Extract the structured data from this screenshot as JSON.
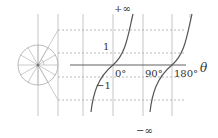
{
  "diagram": {
    "labels": {
      "plus_infinity": "+∞",
      "minus_infinity": "−∞",
      "one": "1",
      "minus_one": "−1",
      "zero_deg": "0°",
      "ninety_deg": "90°",
      "one_eighty_deg": "180°",
      "theta": "θ"
    },
    "colors": {
      "grid": "#b8b8b8",
      "curve": "#555555",
      "axis": "#606060",
      "text": "#333333"
    }
  }
}
